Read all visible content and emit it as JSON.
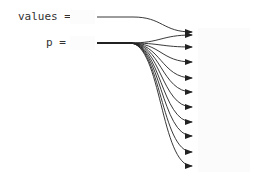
{
  "diagram": {
    "inputs": [
      {
        "name": "values",
        "label": "values =",
        "value": ""
      },
      {
        "name": "p",
        "label": "p =",
        "value": ""
      }
    ],
    "edges": {
      "values": {
        "from": [
          97,
          17
        ],
        "bend_x": 133,
        "to": [
          [
            192,
            32
          ]
        ]
      },
      "p": {
        "from": [
          97,
          43
        ],
        "bend_x": 130,
        "to": [
          [
            192,
            35
          ],
          [
            192,
            47
          ],
          [
            192,
            62
          ],
          [
            192,
            78
          ],
          [
            192,
            92
          ],
          [
            192,
            107
          ],
          [
            192,
            122
          ],
          [
            192,
            136
          ],
          [
            192,
            152
          ],
          [
            192,
            166
          ]
        ]
      }
    },
    "target_count": 11,
    "colors": {
      "line": "#222222",
      "text": "#333333",
      "background": "#ffffff"
    }
  }
}
